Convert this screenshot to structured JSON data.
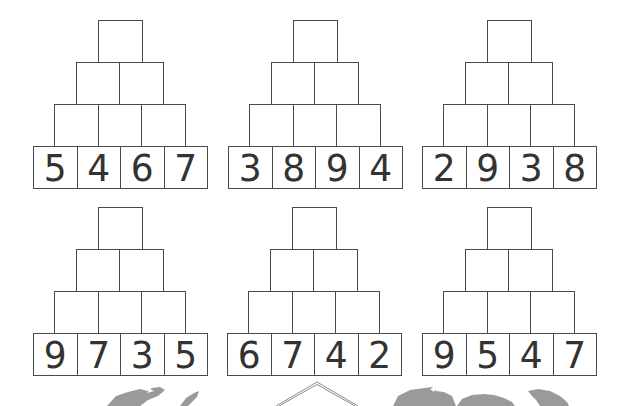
{
  "worksheet": {
    "type": "number-pyramids",
    "pyramids": [
      {
        "base": [
          "5",
          "4",
          "6",
          "7"
        ],
        "rows_empty": [
          3,
          2,
          1
        ]
      },
      {
        "base": [
          "3",
          "8",
          "9",
          "4"
        ],
        "rows_empty": [
          3,
          2,
          1
        ]
      },
      {
        "base": [
          "2",
          "9",
          "3",
          "8"
        ],
        "rows_empty": [
          3,
          2,
          1
        ]
      },
      {
        "base": [
          "9",
          "7",
          "3",
          "5"
        ],
        "rows_empty": [
          3,
          2,
          1
        ]
      },
      {
        "base": [
          "6",
          "7",
          "4",
          "2"
        ],
        "rows_empty": [
          3,
          2,
          1
        ]
      },
      {
        "base": [
          "9",
          "5",
          "4",
          "7"
        ],
        "rows_empty": [
          3,
          2,
          1
        ]
      }
    ]
  },
  "colors": {
    "border": "#4a4a4a",
    "digit": "#222222",
    "decoration": "#9a9a9a",
    "background": "#ffffff"
  }
}
